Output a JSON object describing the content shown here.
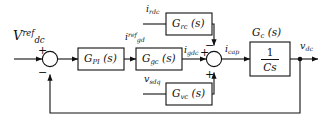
{
  "diagram": {
    "type": "control-block-diagram",
    "colors": {
      "line": "#111111",
      "block_fill": "#ffffff",
      "block_stroke": "#111111",
      "background": "#ffffff"
    },
    "inputs": [
      {
        "id": "vdc_ref",
        "label_main": "V",
        "label_sub": "dc",
        "label_sup": "ref",
        "position": "left"
      },
      {
        "id": "irdc",
        "label_main": "i",
        "label_sub": "rdc",
        "label_sup": "",
        "position": "top-branch"
      },
      {
        "id": "vsdq",
        "label_main": "v",
        "label_sub": "sdq",
        "label_sup": "",
        "position": "bottom-branch"
      }
    ],
    "outputs": [
      {
        "id": "vdc_out",
        "label_main": "v",
        "label_sub": "dc",
        "label_sup": ""
      }
    ],
    "blocks": [
      {
        "id": "gpi",
        "name_main": "G",
        "name_sub": "PI",
        "arg": "(s)",
        "label": "G_PI (s)"
      },
      {
        "id": "ggc",
        "name_main": "G",
        "name_sub": "gc",
        "arg": "(s)",
        "label": "G_gc (s)"
      },
      {
        "id": "grc",
        "name_main": "G",
        "name_sub": "rc",
        "arg": "(s)",
        "label": "G_rc (s)"
      },
      {
        "id": "gvc",
        "name_main": "G",
        "name_sub": "vc",
        "arg": "(s)",
        "label": "G_vc (s)"
      },
      {
        "id": "gc_plant",
        "name_main": "G",
        "name_sub": "c",
        "arg": "(s)",
        "label": "G_c (s)",
        "transfer_numerator": "1",
        "transfer_denominator": "Cs"
      }
    ],
    "signals": [
      {
        "id": "igd_ref",
        "main": "i",
        "sub": "gd",
        "sup": "ref"
      },
      {
        "id": "igdc",
        "main": "i",
        "sub": "gdc",
        "sup": ""
      },
      {
        "id": "icap",
        "main": "i",
        "sub": "cap",
        "sup": ""
      }
    ],
    "summing_junctions": [
      {
        "id": "sum1",
        "signs": [
          {
            "id": "sum1-plus",
            "glyph": "+",
            "port": "top-left"
          },
          {
            "id": "sum1-minus",
            "glyph": "−",
            "port": "bottom-left"
          }
        ]
      },
      {
        "id": "sum2",
        "signs": [
          {
            "id": "sum2-minus-top",
            "glyph": "−",
            "port": "top-right"
          },
          {
            "id": "sum2-plus-left",
            "glyph": "+",
            "port": "left"
          },
          {
            "id": "sum2-plus-bottom",
            "glyph": "+",
            "port": "bottom"
          }
        ]
      }
    ]
  }
}
